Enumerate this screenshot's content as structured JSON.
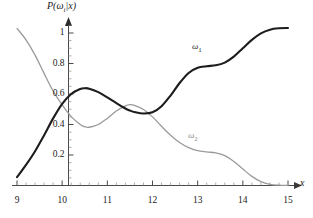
{
  "figure": {
    "background_color": "#ffffff",
    "width": 313,
    "height": 218
  },
  "axes": {
    "y_axis_title": "P(ωᵢ|x)",
    "x_axis_title": "x",
    "x_ticks": [
      "9",
      "10",
      "11",
      "12",
      "13",
      "14",
      "15"
    ],
    "y_ticks": [
      "0.2",
      "0.4",
      "0.6",
      "0.8",
      "1"
    ]
  },
  "labels": {
    "omega1": "ω",
    "omega1_sub": "1",
    "omega2": "ω",
    "omega2_sub": "2"
  },
  "colors": {
    "omega1_curve": "#1c1c1c",
    "omega2_curve": "#9a9a9a",
    "axis": "#4a4a4a",
    "text": "#222222"
  },
  "chart_data": {
    "type": "line",
    "title": "",
    "xlabel": "x",
    "ylabel": "P(ωᵢ|x)",
    "xlim": [
      9,
      15
    ],
    "ylim": [
      0,
      1.08
    ],
    "xticks": [
      9,
      10,
      11,
      12,
      13,
      14,
      15
    ],
    "yticks": [
      0.2,
      0.4,
      0.6,
      0.8,
      1.0
    ],
    "grid": false,
    "legend": "inline-annotation",
    "annotations": [
      {
        "text": "ω₁",
        "x": 13.0,
        "y": 0.885,
        "color": "#1c1c1c"
      },
      {
        "text": "ω₂",
        "x": 12.9,
        "y": 0.3,
        "color": "#9a9a9a"
      }
    ],
    "x": [
      9.0,
      9.2,
      9.4,
      9.6,
      9.8,
      10.0,
      10.2,
      10.4,
      10.5,
      10.6,
      10.8,
      11.0,
      11.2,
      11.4,
      11.5,
      11.6,
      11.8,
      12.0,
      12.2,
      12.4,
      12.6,
      12.8,
      13.0,
      13.2,
      13.4,
      13.6,
      13.8,
      14.0,
      14.2,
      14.4,
      14.6,
      14.8,
      15.0
    ],
    "series": [
      {
        "name": "ω₁",
        "color": "#1c1c1c",
        "linewidth": 2.1,
        "values": [
          0.055,
          0.135,
          0.225,
          0.33,
          0.44,
          0.535,
          0.6,
          0.633,
          0.638,
          0.635,
          0.612,
          0.578,
          0.54,
          0.505,
          0.492,
          0.482,
          0.472,
          0.48,
          0.52,
          0.59,
          0.672,
          0.738,
          0.772,
          0.782,
          0.788,
          0.806,
          0.845,
          0.9,
          0.955,
          0.998,
          1.022,
          1.031,
          1.033
        ]
      },
      {
        "name": "ω₂",
        "color": "#9a9a9a",
        "linewidth": 1.3,
        "values": [
          1.03,
          0.955,
          0.855,
          0.735,
          0.62,
          0.528,
          0.452,
          0.4,
          0.385,
          0.382,
          0.4,
          0.44,
          0.488,
          0.522,
          0.53,
          0.525,
          0.498,
          0.45,
          0.388,
          0.33,
          0.282,
          0.248,
          0.228,
          0.22,
          0.214,
          0.196,
          0.158,
          0.108,
          0.06,
          0.026,
          0.008,
          0.002,
          0.0
        ]
      }
    ]
  }
}
